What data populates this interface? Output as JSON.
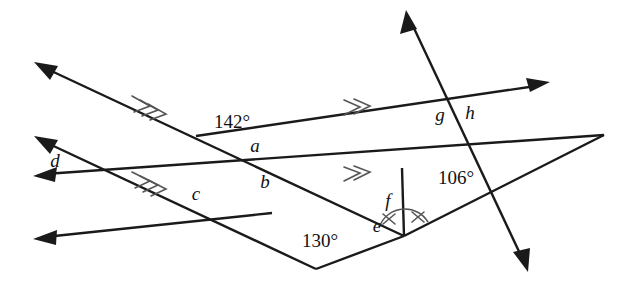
{
  "figure": {
    "title": "Angle relationships diagram with parallel lines and transversals",
    "background": "#ffffff",
    "ink": "#1a1a1a",
    "width": 621,
    "height": 294
  },
  "angle_measures": [
    {
      "id": "a142",
      "text": "142°",
      "x": 232,
      "y": 124
    },
    {
      "id": "a130",
      "text": "130°",
      "x": 320,
      "y": 243
    },
    {
      "id": "a106",
      "text": "106°",
      "x": 456,
      "y": 180
    }
  ],
  "angle_labels": [
    {
      "id": "a",
      "text": "a",
      "x": 255,
      "y": 148
    },
    {
      "id": "b",
      "text": "b",
      "x": 265,
      "y": 184
    },
    {
      "id": "c",
      "text": "c",
      "x": 196,
      "y": 196
    },
    {
      "id": "d",
      "text": "d",
      "x": 55,
      "y": 163
    },
    {
      "id": "e",
      "text": "e",
      "x": 377,
      "y": 228
    },
    {
      "id": "f",
      "text": "f",
      "x": 388,
      "y": 203
    },
    {
      "id": "g",
      "text": "g",
      "x": 440,
      "y": 117
    },
    {
      "id": "h",
      "text": "h",
      "x": 470,
      "y": 115
    }
  ],
  "lines": [
    {
      "id": "top-line",
      "name": "upper-parallel-line",
      "from": {
        "x": 196,
        "y": 136
      },
      "to": {
        "x": 548,
        "y": 84
      },
      "arrow_end": "end",
      "ticks": 2
    },
    {
      "id": "mid-line",
      "name": "middle-parallel-line",
      "from": {
        "x": 36,
        "y": 175
      },
      "to": {
        "x": 604,
        "y": 135
      },
      "arrow_end": "start",
      "ticks": 2
    },
    {
      "id": "bottom-line",
      "name": "lower-parallel-line",
      "from": {
        "x": 36,
        "y": 238
      },
      "to": {
        "x": 272,
        "y": 213
      },
      "arrow_end": "start",
      "ticks": 0
    },
    {
      "id": "diag-upper",
      "name": "upper-left-transversal",
      "from": {
        "x": 36,
        "y": 64
      },
      "to": {
        "x": 404,
        "y": 236
      },
      "arrow_end": "start",
      "ticks": 3
    },
    {
      "id": "diag-lower",
      "name": "lower-left-transversal",
      "from": {
        "x": 36,
        "y": 138
      },
      "to": {
        "x": 316,
        "y": 269
      },
      "arrow_end": "start",
      "ticks": 3
    },
    {
      "id": "steep",
      "name": "steep-transversal",
      "from": {
        "x": 407,
        "y": 12
      },
      "to": {
        "x": 527,
        "y": 270
      },
      "arrow_end": "both",
      "ticks": 0
    },
    {
      "id": "apex-lower",
      "name": "apex-to-lower-vertex-segment",
      "from": {
        "x": 604,
        "y": 135
      },
      "to": {
        "x": 404,
        "y": 236
      },
      "arrow_end": "none",
      "ticks": 0
    },
    {
      "id": "vertical",
      "name": "vertical-segment",
      "from": {
        "x": 402,
        "y": 169
      },
      "to": {
        "x": 404,
        "y": 236
      },
      "arrow_end": "none",
      "ticks": 0
    },
    {
      "id": "bottom-vee",
      "name": "bottom-vee-segment",
      "from": {
        "x": 316,
        "y": 269
      },
      "to": {
        "x": 404,
        "y": 236
      },
      "arrow_end": "none",
      "ticks": 0
    }
  ],
  "equal_angle_marks": {
    "name": "congruent-angle-arcs",
    "vertex": {
      "x": 404,
      "y": 236
    },
    "count": 2,
    "tick_style": "cross"
  }
}
